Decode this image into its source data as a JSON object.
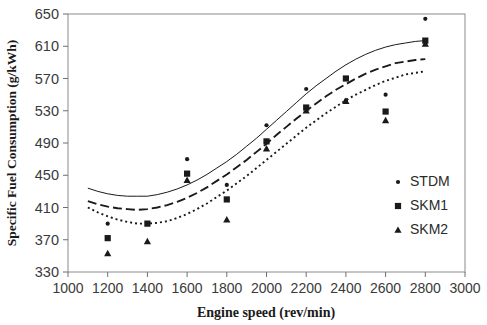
{
  "chart_data": {
    "type": "scatter",
    "title": "",
    "xlabel": "Engine speed (rev/min)",
    "ylabel": "Specific Fuel Consumption (g/kWh)",
    "xlim": [
      1000,
      3000
    ],
    "ylim": [
      330,
      650
    ],
    "xticks": [
      1000,
      1200,
      1400,
      1600,
      1800,
      2000,
      2200,
      2400,
      2600,
      2800,
      3000
    ],
    "yticks": [
      330,
      370,
      410,
      450,
      490,
      530,
      570,
      610,
      650
    ],
    "xtick_labels": [
      "1000",
      "1200",
      "1400",
      "1600",
      "1800",
      "2000",
      "2200",
      "2400",
      "2600",
      "2800",
      "3000"
    ],
    "ytick_labels": [
      "330",
      "370",
      "410",
      "450",
      "490",
      "530",
      "570",
      "610",
      "650"
    ],
    "grid": false,
    "legend_position": "right-middle",
    "series": [
      {
        "name": "STDM",
        "marker": "small-dot",
        "color": "#1a1a1a",
        "trendline_style": "solid",
        "x": [
          1200,
          1600,
          1800,
          2000,
          2200,
          2400,
          2600,
          2800
        ],
        "y": [
          390,
          470,
          438,
          512,
          557,
          543,
          550,
          644
        ]
      },
      {
        "name": "SKM1",
        "marker": "square",
        "color": "#1a1a1a",
        "trendline_style": "dashed",
        "x": [
          1200,
          1400,
          1600,
          1800,
          2000,
          2200,
          2400,
          2600,
          2800
        ],
        "y": [
          372,
          390,
          452,
          420,
          492,
          534,
          570,
          529,
          617
        ]
      },
      {
        "name": "SKM2",
        "marker": "triangle",
        "color": "#1a1a1a",
        "trendline_style": "dotted",
        "x": [
          1200,
          1400,
          1600,
          1800,
          2000,
          2200,
          2400,
          2600,
          2800
        ],
        "y": [
          353,
          368,
          444,
          395,
          483,
          530,
          542,
          518,
          613
        ]
      }
    ],
    "trendlines": [
      {
        "name": "STDM",
        "style": "solid",
        "points": [
          [
            1100,
            434
          ],
          [
            1150,
            430
          ],
          [
            1200,
            427
          ],
          [
            1250,
            425
          ],
          [
            1300,
            424
          ],
          [
            1350,
            424
          ],
          [
            1400,
            424
          ],
          [
            1450,
            426
          ],
          [
            1500,
            429
          ],
          [
            1550,
            433
          ],
          [
            1600,
            438
          ],
          [
            1650,
            444
          ],
          [
            1700,
            451
          ],
          [
            1750,
            459
          ],
          [
            1800,
            467
          ],
          [
            1850,
            476
          ],
          [
            1900,
            486
          ],
          [
            1950,
            496
          ],
          [
            2000,
            507
          ],
          [
            2050,
            518
          ],
          [
            2100,
            529
          ],
          [
            2150,
            540
          ],
          [
            2200,
            551
          ],
          [
            2250,
            561
          ],
          [
            2300,
            570
          ],
          [
            2350,
            579
          ],
          [
            2400,
            587
          ],
          [
            2450,
            594
          ],
          [
            2500,
            600
          ],
          [
            2550,
            605
          ],
          [
            2600,
            609
          ],
          [
            2650,
            612
          ],
          [
            2700,
            614
          ],
          [
            2750,
            616
          ],
          [
            2800,
            617
          ]
        ]
      },
      {
        "name": "SKM1",
        "style": "dashed",
        "points": [
          [
            1100,
            418
          ],
          [
            1150,
            414
          ],
          [
            1200,
            411
          ],
          [
            1250,
            409
          ],
          [
            1300,
            408
          ],
          [
            1350,
            407
          ],
          [
            1400,
            408
          ],
          [
            1450,
            410
          ],
          [
            1500,
            413
          ],
          [
            1550,
            417
          ],
          [
            1600,
            422
          ],
          [
            1650,
            428
          ],
          [
            1700,
            435
          ],
          [
            1750,
            443
          ],
          [
            1800,
            451
          ],
          [
            1850,
            460
          ],
          [
            1900,
            469
          ],
          [
            1950,
            479
          ],
          [
            2000,
            489
          ],
          [
            2050,
            500
          ],
          [
            2100,
            510
          ],
          [
            2150,
            520
          ],
          [
            2200,
            530
          ],
          [
            2250,
            539
          ],
          [
            2300,
            548
          ],
          [
            2350,
            556
          ],
          [
            2400,
            563
          ],
          [
            2450,
            570
          ],
          [
            2500,
            576
          ],
          [
            2550,
            581
          ],
          [
            2600,
            585
          ],
          [
            2650,
            589
          ],
          [
            2700,
            591
          ],
          [
            2750,
            593
          ],
          [
            2800,
            594
          ]
        ]
      },
      {
        "name": "SKM2",
        "style": "dotted",
        "points": [
          [
            1100,
            410
          ],
          [
            1150,
            404
          ],
          [
            1200,
            399
          ],
          [
            1250,
            395
          ],
          [
            1300,
            392
          ],
          [
            1350,
            390
          ],
          [
            1400,
            390
          ],
          [
            1450,
            391
          ],
          [
            1500,
            393
          ],
          [
            1550,
            397
          ],
          [
            1600,
            402
          ],
          [
            1650,
            408
          ],
          [
            1700,
            415
          ],
          [
            1750,
            423
          ],
          [
            1800,
            431
          ],
          [
            1850,
            440
          ],
          [
            1900,
            449
          ],
          [
            1950,
            459
          ],
          [
            2000,
            469
          ],
          [
            2050,
            479
          ],
          [
            2100,
            489
          ],
          [
            2150,
            499
          ],
          [
            2200,
            509
          ],
          [
            2250,
            518
          ],
          [
            2300,
            527
          ],
          [
            2350,
            535
          ],
          [
            2400,
            543
          ],
          [
            2450,
            550
          ],
          [
            2500,
            556
          ],
          [
            2550,
            562
          ],
          [
            2600,
            567
          ],
          [
            2650,
            571
          ],
          [
            2700,
            575
          ],
          [
            2750,
            577
          ],
          [
            2800,
            579
          ]
        ]
      }
    ],
    "legend": [
      {
        "label": "STDM",
        "marker": "small-dot"
      },
      {
        "label": "SKM1",
        "marker": "square"
      },
      {
        "label": "SKM2",
        "marker": "triangle"
      }
    ]
  },
  "colors": {
    "axis": "#6e6e6e",
    "ink": "#1a1a1a",
    "background": "#ffffff"
  }
}
